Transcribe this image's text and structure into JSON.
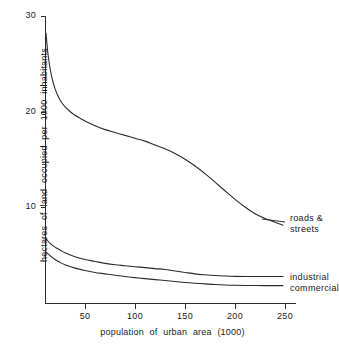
{
  "chart_data": {
    "type": "line",
    "title": "",
    "xlabel": "population of urban area  (1000)",
    "ylabel": "hectares  of  land  occupied  per  1000  inhabitants",
    "xlim": [
      10,
      260
    ],
    "ylim": [
      0,
      30
    ],
    "grid": false,
    "legend_position": "right-inline-labels",
    "x_ticks": [
      "50",
      "100",
      "150",
      "200",
      "250"
    ],
    "x_tick_values": [
      50,
      100,
      150,
      200,
      250
    ],
    "y_ticks": [
      "10",
      "20",
      "30"
    ],
    "y_tick_values": [
      10,
      20,
      30
    ],
    "series": [
      {
        "name": "roads & streets",
        "label_text": "roads &\nstreets",
        "x": [
          11,
          13,
          16,
          20,
          25,
          30,
          35,
          40,
          45,
          50,
          60,
          70,
          80,
          90,
          100,
          110,
          120,
          130,
          140,
          150,
          160,
          170,
          180,
          190,
          200,
          210,
          220,
          230,
          240,
          248
        ],
        "values": [
          28.2,
          26.0,
          24.0,
          22.4,
          21.2,
          20.5,
          20.0,
          19.6,
          19.3,
          19.0,
          18.5,
          18.1,
          17.8,
          17.5,
          17.2,
          16.9,
          16.5,
          16.1,
          15.6,
          15.0,
          14.3,
          13.5,
          12.6,
          11.7,
          10.8,
          10.0,
          9.3,
          8.8,
          8.4,
          8.1
        ]
      },
      {
        "name": "industrial",
        "label_text": "industrial",
        "x": [
          11,
          15,
          20,
          25,
          30,
          40,
          50,
          60,
          70,
          80,
          90,
          100,
          110,
          120,
          130,
          140,
          150,
          160,
          170,
          180,
          190,
          200,
          215,
          230,
          248
        ],
        "values": [
          6.7,
          6.2,
          5.8,
          5.5,
          5.2,
          4.8,
          4.5,
          4.3,
          4.1,
          3.95,
          3.85,
          3.75,
          3.65,
          3.55,
          3.45,
          3.3,
          3.15,
          3.0,
          2.9,
          2.82,
          2.77,
          2.74,
          2.72,
          2.72,
          2.72
        ]
      },
      {
        "name": "commercial",
        "label_text": "commercial",
        "x": [
          11,
          15,
          20,
          25,
          30,
          40,
          50,
          60,
          70,
          80,
          90,
          100,
          110,
          120,
          130,
          140,
          150,
          160,
          170,
          180,
          190,
          200,
          215,
          230,
          248
        ],
        "values": [
          5.3,
          4.9,
          4.5,
          4.2,
          3.95,
          3.6,
          3.35,
          3.15,
          3.0,
          2.85,
          2.72,
          2.6,
          2.5,
          2.4,
          2.3,
          2.2,
          2.1,
          2.02,
          1.95,
          1.88,
          1.83,
          1.8,
          1.78,
          1.77,
          1.77
        ]
      }
    ],
    "colors": {
      "line": "#2b2b2b",
      "axis": "#2b2b2b",
      "background": "#ffffff",
      "text": "#1a1a1a"
    }
  }
}
